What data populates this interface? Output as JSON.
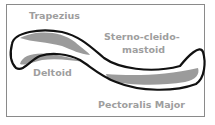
{
  "diagram": {
    "labels": {
      "trapezius": "Trapezius",
      "sterno_line1": "Sterno-cleido-",
      "sterno_line2": "mastoid",
      "deltoid": "Deltoid",
      "pectoralis": "Pectoralis Major"
    },
    "colors": {
      "outline": "#111111",
      "muscle_band": "#9b9b9b",
      "label_text": "#9e9e9e",
      "frame_border": "#8a8a8a"
    }
  }
}
